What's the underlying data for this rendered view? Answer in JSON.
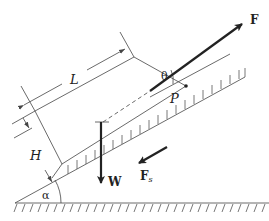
{
  "diagram": {
    "labels": {
      "force_applied": "F",
      "angle_force": "θ",
      "length": "L",
      "height": "H",
      "point": "P",
      "friction_force": "F",
      "friction_subscript": "s",
      "weight": "W",
      "incline_angle": "α"
    },
    "colors": {
      "line": "#444444",
      "arrow": "#222222",
      "background": "#ffffff"
    }
  }
}
